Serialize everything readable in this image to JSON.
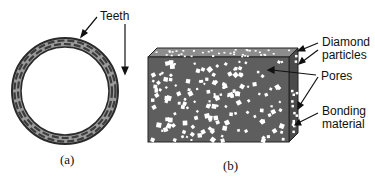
{
  "figure": {
    "panel_a": {
      "caption": "(a)",
      "labels": {
        "teeth": "Teeth"
      },
      "description": "Ring-shaped saw blade with segmented teeth"
    },
    "panel_b": {
      "caption": "(b)",
      "labels": {
        "diamond_particles_line1": "Diamond",
        "diamond_particles_line2": "particles",
        "pores": "Pores",
        "bonding_material_line1": "Bonding",
        "bonding_material_line2": "material"
      },
      "description": "Cross-section block of segment showing diamond particles, pores and bonding material"
    },
    "colors": {
      "ring_outer": "#3a3a3a",
      "ring_band": "#9a9a9a",
      "teeth": "#4a4a4a",
      "block_front": "#5e5e5e",
      "block_top": "#8c8c8c",
      "block_side": "#4a4a4a",
      "particles": "#ffffff"
    }
  }
}
